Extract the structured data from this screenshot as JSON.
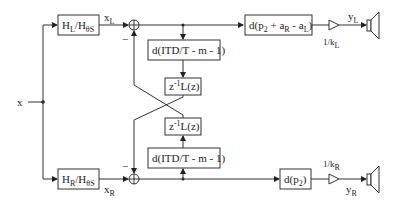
{
  "diagram": {
    "input": {
      "label": "x"
    },
    "filters": {
      "left": {
        "main": "H",
        "main_sub": "L",
        "slash": "/H",
        "slash_sub": "θS"
      },
      "right": {
        "main": "H",
        "main_sub": "R",
        "slash": "/H",
        "slash_sub": "θS"
      }
    },
    "signals": {
      "xL": {
        "main": "x",
        "sub": "L"
      },
      "xR": {
        "main": "x",
        "sub": "R"
      },
      "yL": {
        "main": "y",
        "sub": "L"
      },
      "yR": {
        "main": "y",
        "sub": "R"
      }
    },
    "summers": {
      "top_minus": "−",
      "bottom_minus": "−"
    },
    "crossfeed": {
      "delay_top": "d(ITD/T - m - 1)",
      "delay_bottom": "d(ITD/T - m - 1)",
      "filter_top": {
        "pre": "z",
        "sup": "-1",
        "post": "L(z)"
      },
      "filter_bottom": {
        "pre": "z",
        "sup": "-1",
        "post": "L(z)"
      }
    },
    "output_delays": {
      "left": {
        "pre": "d(p",
        "s1": "2",
        "mid": " + a",
        "s2": "R",
        "mid2": " - a",
        "s3": "L",
        "post": ")"
      },
      "right": {
        "pre": "d(p",
        "s1": "2",
        "post": ")"
      }
    },
    "gains": {
      "left": {
        "main": "1/k",
        "sub": "L"
      },
      "right": {
        "main": "1/k",
        "sub": "R"
      }
    }
  }
}
